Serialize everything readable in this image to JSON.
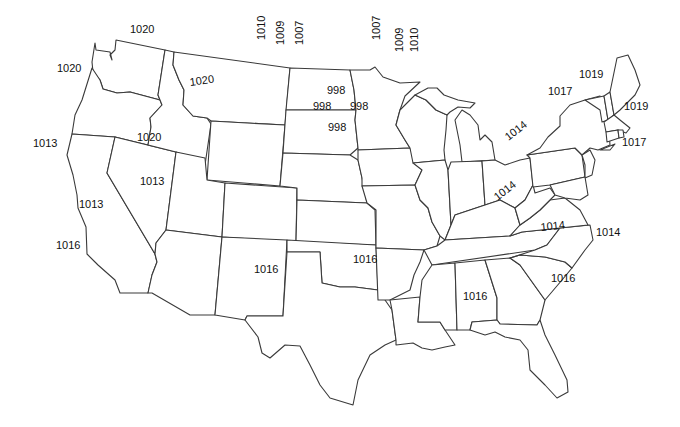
{
  "map": {
    "title": "",
    "type": "isobar-pressure-map",
    "region": "Contiguous United States",
    "colors": {
      "background": "#ffffff",
      "border": "#3a3a3a",
      "label": "#111111"
    },
    "labels": [
      {
        "id": "wa-north",
        "text": "1020",
        "x": 130,
        "y": 24,
        "rot": 0
      },
      {
        "id": "wa-west",
        "text": "1020",
        "x": 57,
        "y": 63,
        "rot": 0
      },
      {
        "id": "mt",
        "text": "1020",
        "x": 189,
        "y": 77,
        "rot": -8
      },
      {
        "id": "id-south",
        "text": "1020",
        "x": 137,
        "y": 132,
        "rot": 0
      },
      {
        "id": "nd-1010",
        "text": "1010",
        "x": 256,
        "y": 40,
        "rot": -90
      },
      {
        "id": "nd-1009",
        "text": "1009",
        "x": 275,
        "y": 45,
        "rot": -90
      },
      {
        "id": "nd-1007",
        "text": "1007",
        "x": 294,
        "y": 45,
        "rot": -90
      },
      {
        "id": "mn-1007",
        "text": "1007",
        "x": 371,
        "y": 40,
        "rot": -90
      },
      {
        "id": "mn-1009",
        "text": "1009",
        "x": 394,
        "y": 52,
        "rot": -90
      },
      {
        "id": "mn-1010",
        "text": "1010",
        "x": 409,
        "y": 52,
        "rot": -90
      },
      {
        "id": "nd-998",
        "text": "998",
        "x": 327,
        "y": 85,
        "rot": 0
      },
      {
        "id": "sd-998a",
        "text": "998",
        "x": 313,
        "y": 101,
        "rot": 0
      },
      {
        "id": "mn-998",
        "text": "998",
        "x": 350,
        "y": 101,
        "rot": 0
      },
      {
        "id": "sd-998b",
        "text": "998",
        "x": 328,
        "y": 122,
        "rot": 0
      },
      {
        "id": "or-south",
        "text": "1013",
        "x": 33,
        "y": 138,
        "rot": 0
      },
      {
        "id": "nv",
        "text": "1013",
        "x": 140,
        "y": 176,
        "rot": 0
      },
      {
        "id": "ca-north",
        "text": "1013",
        "x": 79,
        "y": 199,
        "rot": 0
      },
      {
        "id": "ca-south",
        "text": "1016",
        "x": 56,
        "y": 240,
        "rot": 0
      },
      {
        "id": "nm",
        "text": "1016",
        "x": 254,
        "y": 264,
        "rot": 0
      },
      {
        "id": "ok",
        "text": "1016",
        "x": 353,
        "y": 254,
        "rot": 0
      },
      {
        "id": "mi",
        "text": "1014",
        "x": 503,
        "y": 134,
        "rot": -38
      },
      {
        "id": "oh",
        "text": "1014",
        "x": 492,
        "y": 194,
        "rot": -38
      },
      {
        "id": "va",
        "text": "1014",
        "x": 540,
        "y": 222,
        "rot": -6
      },
      {
        "id": "nc-coast",
        "text": "1014",
        "x": 596,
        "y": 227,
        "rot": 0
      },
      {
        "id": "sc",
        "text": "1016",
        "x": 551,
        "y": 273,
        "rot": 0
      },
      {
        "id": "al",
        "text": "1016",
        "x": 463,
        "y": 291,
        "rot": 0
      },
      {
        "id": "ny",
        "text": "1017",
        "x": 548,
        "y": 86,
        "rot": 0
      },
      {
        "id": "me-west",
        "text": "1019",
        "x": 579,
        "y": 69,
        "rot": 0
      },
      {
        "id": "me-east",
        "text": "1019",
        "x": 624,
        "y": 101,
        "rot": 0
      },
      {
        "id": "ri-coast",
        "text": "1017",
        "x": 622,
        "y": 137,
        "rot": 0
      }
    ]
  }
}
